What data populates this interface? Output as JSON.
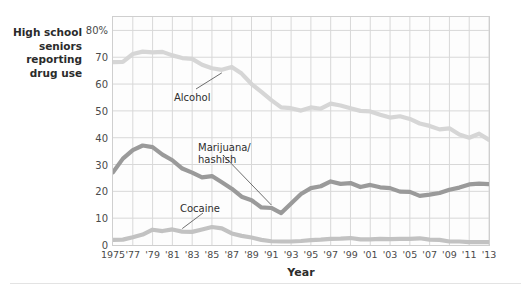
{
  "chart_data": {
    "type": "line",
    "title": "",
    "ylabel": "High school seniors reporting drug use",
    "ylabel_lines": [
      "High school",
      "seniors",
      "reporting",
      "drug use"
    ],
    "xlabel": "Year",
    "ylim": [
      0,
      85
    ],
    "yticks": [
      0,
      10,
      20,
      30,
      40,
      50,
      60,
      70,
      80
    ],
    "ytick_labels": [
      "0",
      "10",
      "20",
      "30",
      "40",
      "50",
      "60",
      "70",
      "80%"
    ],
    "xlim": [
      1975,
      2013
    ],
    "xticks": [
      1975,
      1977,
      1979,
      1981,
      1983,
      1985,
      1987,
      1989,
      1991,
      1993,
      1995,
      1997,
      1999,
      2001,
      2003,
      2005,
      2007,
      2009,
      2011,
      2013
    ],
    "xtick_labels": [
      "1975",
      "'77",
      "'79",
      "'81",
      "'83",
      "'85",
      "'87",
      "'89",
      "'91",
      "'93",
      "'95",
      "'97",
      "'99",
      "'01",
      "'03",
      "'05",
      "'07",
      "'09",
      "'11",
      "'13"
    ],
    "grid": true,
    "legend_position": "inline-annotations",
    "x": [
      1975,
      1976,
      1977,
      1978,
      1979,
      1980,
      1981,
      1982,
      1983,
      1984,
      1985,
      1986,
      1987,
      1988,
      1989,
      1990,
      1991,
      1992,
      1993,
      1994,
      1995,
      1996,
      1997,
      1998,
      1999,
      2000,
      2001,
      2002,
      2003,
      2004,
      2005,
      2006,
      2007,
      2008,
      2009,
      2010,
      2011,
      2012,
      2013
    ],
    "series": [
      {
        "name": "Alcohol",
        "color": "#d6d6d6",
        "values": [
          68.2,
          68.3,
          71.2,
          72.1,
          71.8,
          72.0,
          70.7,
          69.7,
          69.4,
          67.2,
          65.9,
          65.3,
          66.4,
          63.9,
          60.0,
          57.1,
          54.0,
          51.3,
          51.0,
          50.1,
          51.3,
          50.8,
          52.7,
          52.0,
          51.0,
          50.0,
          49.8,
          48.6,
          47.5,
          48.0,
          47.0,
          45.3,
          44.4,
          43.1,
          43.5,
          41.2,
          40.0,
          41.5,
          39.2
        ]
      },
      {
        "name": "Marijuana/hashish",
        "color": "#9a9a9a",
        "values": [
          27.1,
          32.2,
          35.4,
          37.1,
          36.5,
          33.7,
          31.6,
          28.5,
          27.0,
          25.2,
          25.7,
          23.4,
          21.0,
          18.0,
          16.7,
          14.0,
          13.8,
          11.9,
          15.5,
          19.0,
          21.2,
          21.9,
          23.7,
          22.8,
          23.1,
          21.6,
          22.4,
          21.5,
          21.2,
          19.9,
          19.8,
          18.3,
          18.8,
          19.4,
          20.6,
          21.4,
          22.6,
          22.9,
          22.7
        ]
      },
      {
        "name": "Cocaine",
        "color": "#c2c2c2",
        "values": [
          1.9,
          2.0,
          2.9,
          3.9,
          5.7,
          5.2,
          5.8,
          5.0,
          4.9,
          5.8,
          6.7,
          6.2,
          4.3,
          3.4,
          2.8,
          1.9,
          1.4,
          1.3,
          1.3,
          1.5,
          1.8,
          2.0,
          2.3,
          2.4,
          2.6,
          2.1,
          2.1,
          2.3,
          2.2,
          2.3,
          2.3,
          2.5,
          2.0,
          1.9,
          1.3,
          1.3,
          1.1,
          1.1,
          1.1
        ]
      }
    ],
    "annotations": [
      {
        "name": "Alcohol",
        "label_lines": [
          "Alcohol"
        ]
      },
      {
        "name": "Marijuana/hashish",
        "label_lines": [
          "Marijuana/",
          "hashish"
        ]
      },
      {
        "name": "Cocaine",
        "label_lines": [
          "Cocaine"
        ]
      }
    ]
  }
}
